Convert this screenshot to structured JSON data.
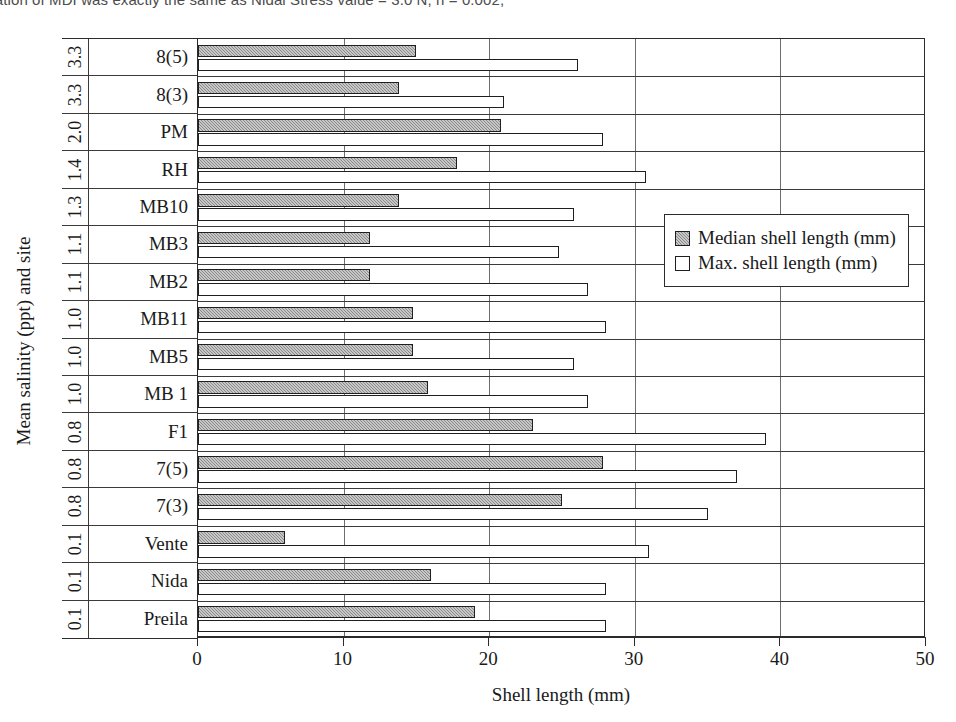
{
  "caption": {
    "text": "...ation of MDI was exactly the same as Nidal Stress value = 3.0 N, n = 0.002,"
  },
  "chart_data": {
    "type": "bar",
    "orientation": "horizontal",
    "title": "",
    "xlabel": "Shell length (mm)",
    "ylabel": "Mean salinity (ppt) and site",
    "xlim": [
      0,
      50
    ],
    "xticks": [
      0,
      10,
      20,
      30,
      40,
      50
    ],
    "grid": "vertical",
    "legend_position": "right-middle",
    "categories": [
      "Preila",
      "Nida",
      "Vente",
      "7(3)",
      "7(5)",
      "F1",
      "MB 1",
      "MB5",
      "MB11",
      "MB2",
      "MB3",
      "MB10",
      "RH",
      "PM",
      "8(3)",
      "8(5)"
    ],
    "salinity": [
      "0.1",
      "0.1",
      "0.1",
      "0.8",
      "0.8",
      "0.8",
      "1.0",
      "1.0",
      "1.0",
      "1.1",
      "1.1",
      "1.3",
      "1.4",
      "2.0",
      "3.3",
      "3.3"
    ],
    "series": [
      {
        "name": "Median shell length (mm)",
        "fill": "#9b9b9b",
        "values": [
          19.0,
          16.0,
          6.0,
          25.0,
          27.8,
          23.0,
          15.8,
          14.8,
          14.8,
          11.8,
          11.8,
          13.8,
          17.8,
          20.8,
          13.8,
          15.0
        ]
      },
      {
        "name": "Max. shell length (mm)",
        "fill": "#ffffff",
        "values": [
          28.0,
          28.0,
          31.0,
          35.0,
          37.0,
          39.0,
          26.8,
          25.8,
          28.0,
          26.8,
          24.8,
          25.8,
          30.8,
          27.8,
          21.0,
          26.1
        ]
      }
    ]
  }
}
